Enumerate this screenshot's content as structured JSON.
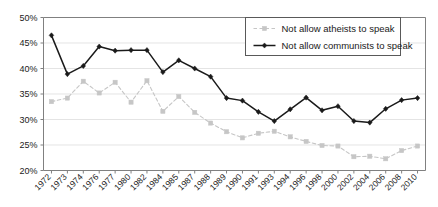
{
  "chart_data": {
    "type": "line",
    "title": "",
    "xlabel": "",
    "ylabel": "",
    "ylim": [
      20,
      50
    ],
    "ytick_step": 5,
    "ytick_labels": [
      "20%",
      "25%",
      "30%",
      "35%",
      "40%",
      "45%",
      "50%"
    ],
    "ytick_values": [
      20,
      25,
      30,
      35,
      40,
      45,
      50
    ],
    "grid": true,
    "legend_position": "top-right",
    "categories": [
      "1972",
      "1973",
      "1974",
      "1976",
      "1977",
      "1980",
      "1982",
      "1984",
      "1985",
      "1987",
      "1988",
      "1989",
      "1990",
      "1991",
      "1993",
      "1994",
      "1996",
      "1998",
      "2000",
      "2002",
      "2004",
      "2006",
      "2008",
      "2010"
    ],
    "series": [
      {
        "name": "Not allow atheists to speak",
        "color": "#c6c6c6",
        "marker": "square",
        "dash": "dashed",
        "values": [
          33.5,
          34.2,
          37.5,
          35.2,
          37.3,
          33.4,
          37.6,
          31.6,
          34.5,
          31.4,
          29.3,
          27.6,
          26.4,
          27.3,
          27.7,
          26.6,
          25.7,
          24.9,
          24.8,
          22.7,
          22.8,
          22.3,
          23.9,
          24.8
        ]
      },
      {
        "name": "Not allow communists to speak",
        "color": "#1a1a1a",
        "marker": "diamond",
        "dash": "solid",
        "values": [
          46.5,
          38.9,
          40.5,
          44.3,
          43.5,
          43.6,
          43.6,
          39.3,
          41.6,
          40.0,
          38.4,
          34.2,
          33.7,
          31.5,
          29.7,
          32.0,
          34.3,
          31.8,
          32.6,
          29.7,
          29.4,
          32.1,
          33.8,
          34.2
        ]
      }
    ]
  },
  "legend": {
    "entries": [
      {
        "label": "Not allow atheists to speak"
      },
      {
        "label": "Not allow communists to speak"
      }
    ]
  }
}
